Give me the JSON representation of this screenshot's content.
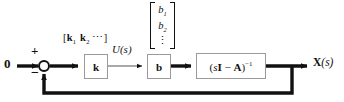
{
  "diagram": {
    "type": "control-system-block-diagram",
    "background_color": "#ffffff",
    "line_color": "#111111",
    "block_border_color": "#9a9a9a",
    "input": {
      "label": "0"
    },
    "summing_junction": {
      "plus_label": "+",
      "minus_label": "−",
      "shape": "circle",
      "fill": "#ffffff"
    },
    "signals": {
      "u_of_s": "U(s)",
      "x_of_s_bold": "X",
      "x_of_s_arg": "(s)"
    },
    "gain_vector": {
      "open_bracket": "[",
      "k1": "k",
      "k1_sub": "1",
      "k2": "k",
      "k2_sub": "2",
      "ellipsis": "⋯",
      "close_bracket": "]"
    },
    "b_vector": {
      "entry1": "b",
      "entry1_sub": "1",
      "entry2": "b",
      "entry2_sub": "2",
      "vertical_dots": "⋮"
    },
    "blocks": [
      {
        "id": "k",
        "label": "k"
      },
      {
        "id": "b",
        "label": "b"
      }
    ],
    "resolvent_block": {
      "open_paren": "(",
      "s_var": "s",
      "identity": "I",
      "minus": "−",
      "a_matrix": "A",
      "close_paren": ")",
      "exponent": "−1"
    }
  }
}
